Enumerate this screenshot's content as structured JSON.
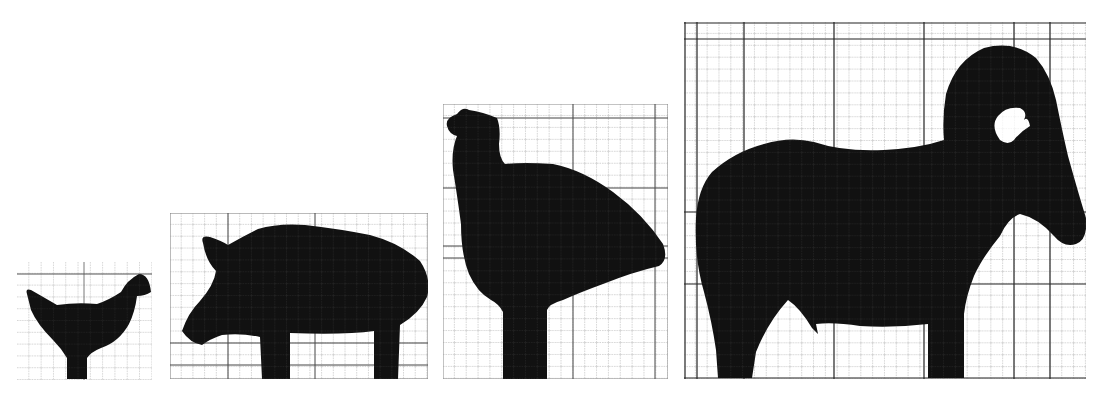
{
  "figure": {
    "background": "#ffffff",
    "ink": "#111111",
    "grid_major": "#333333",
    "grid_minor": "#9a9a9a",
    "panels": [
      {
        "id": "chicken",
        "label": "Chicken silhouette",
        "bbox": {
          "x": 17,
          "y": 262,
          "w": 135,
          "h": 118
        },
        "grid_cells": {
          "cols": 11,
          "rows": 10
        }
      },
      {
        "id": "pig",
        "label": "Pig silhouette",
        "bbox": {
          "x": 170,
          "y": 213,
          "w": 258,
          "h": 166
        },
        "grid_cells": {
          "cols": 22,
          "rows": 14
        }
      },
      {
        "id": "turkey",
        "label": "Turkey silhouette",
        "bbox": {
          "x": 443,
          "y": 104,
          "w": 225,
          "h": 275
        },
        "grid_cells": {
          "cols": 19,
          "rows": 23
        }
      },
      {
        "id": "ram",
        "label": "Ram silhouette",
        "bbox": {
          "x": 684,
          "y": 22,
          "w": 402,
          "h": 357
        },
        "grid_cells": {
          "cols": 34,
          "rows": 30
        }
      }
    ]
  }
}
